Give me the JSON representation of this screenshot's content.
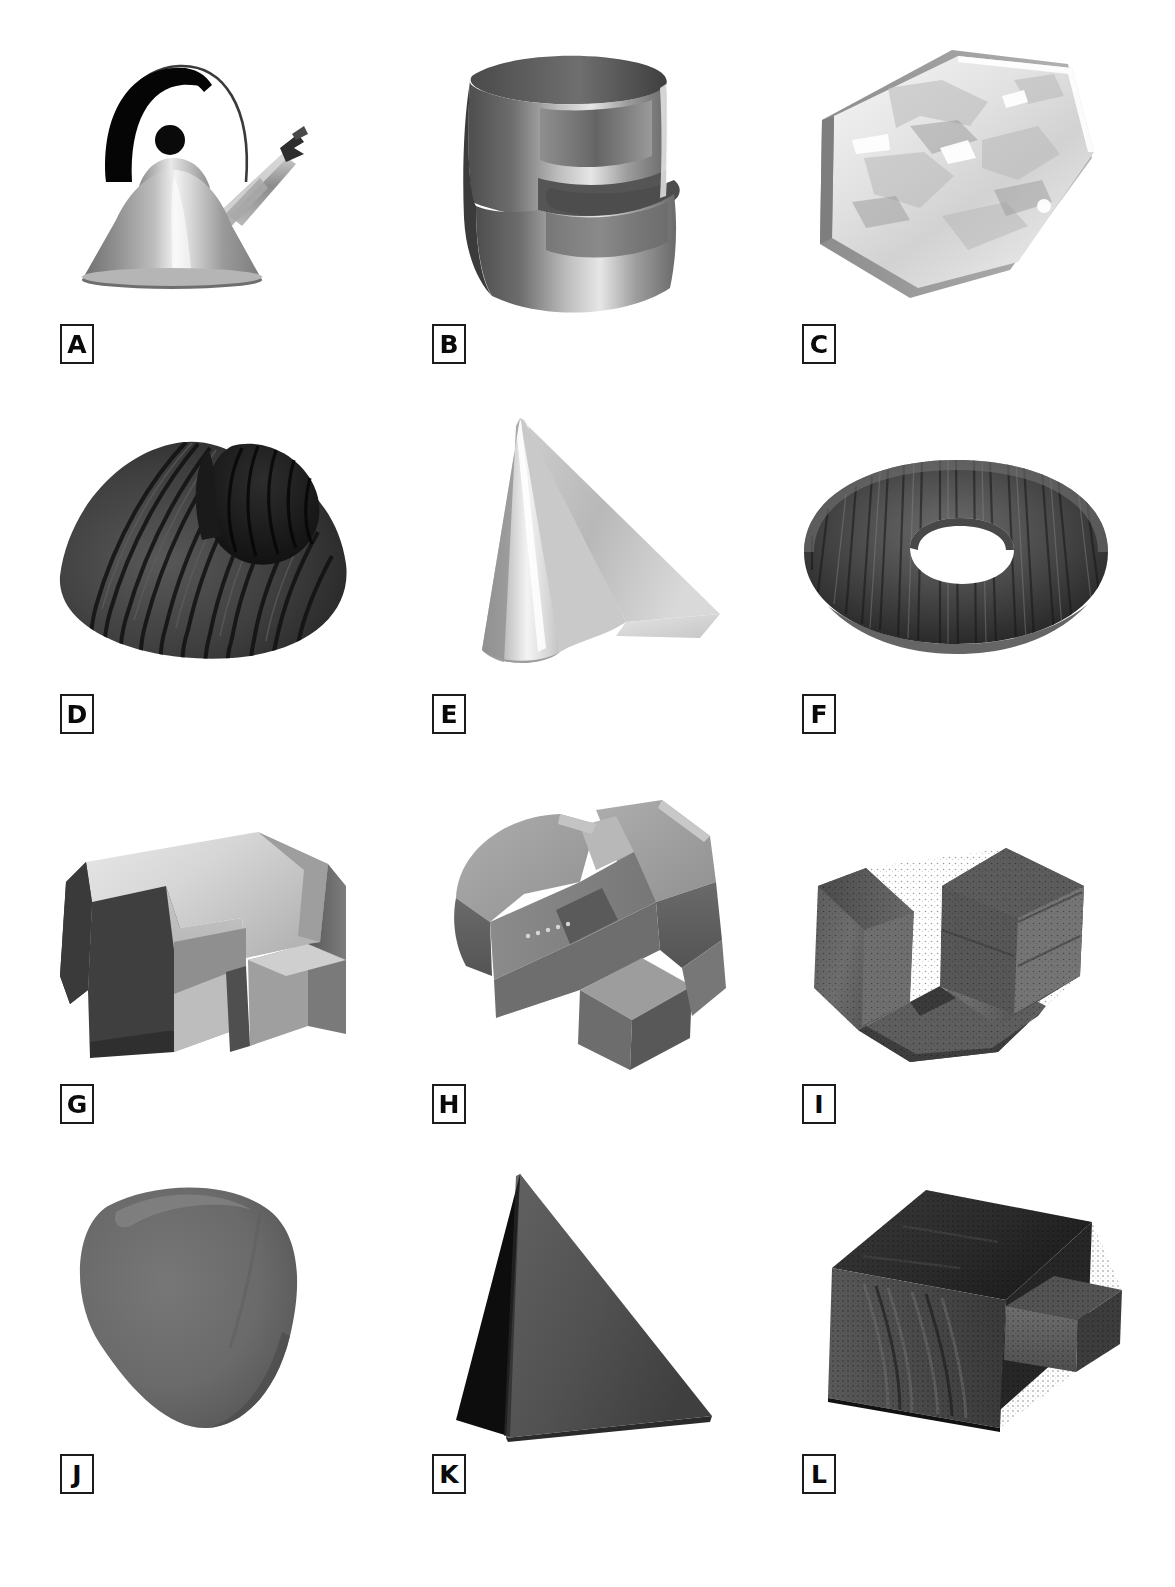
{
  "plate": {
    "background_color": "#ffffff",
    "columns": 3,
    "rows": 4,
    "label_style": "boxed-uppercase-letter"
  },
  "figures": [
    {
      "label": "A",
      "name": "teakettle",
      "description": "Conical stainless teakettle with black arc handle, wire loop, knob and bird whistle spout",
      "row": 1,
      "col": 1,
      "tone": "light-gray-specular"
    },
    {
      "label": "B",
      "name": "curved-spiral-extrusion",
      "description": "Smooth E-shaped / spiral curved ribbon extrusion, metallic shading",
      "row": 1,
      "col": 2,
      "tone": "mid-gray-gradient"
    },
    {
      "label": "C",
      "name": "hexagonal-slab",
      "description": "Flat hexagonal crystal slab with mottled bright texture",
      "row": 1,
      "col": 3,
      "tone": "very-light-gray-mottled"
    },
    {
      "label": "D",
      "name": "ribbed-shell",
      "description": "Dark ribbed bivalve shell form with concentric growth ridges",
      "row": 2,
      "col": 1,
      "tone": "dark-gray-ribbed"
    },
    {
      "label": "E",
      "name": "cone-with-fin",
      "description": "Light cone with a flat triangular fin projecting to the right",
      "row": 2,
      "col": 2,
      "tone": "light-gray"
    },
    {
      "label": "F",
      "name": "torus",
      "description": "Dark textured torus / donut seen obliquely",
      "row": 2,
      "col": 3,
      "tone": "dark-gray-textured"
    },
    {
      "label": "G",
      "name": "notched-block",
      "description": "Angular polyhedral block with stepped notches and a bright top face",
      "row": 3,
      "col": 1,
      "tone": "mixed-gray-faceted"
    },
    {
      "label": "H",
      "name": "interlocked-block",
      "description": "Mid-gray angular twisted block with interlocking L arms",
      "row": 3,
      "col": 2,
      "tone": "mid-gray-faceted"
    },
    {
      "label": "I",
      "name": "c-shaped-cylinder",
      "description": "Dark textured cylindrical block with a wedge cut, C-shaped profile",
      "row": 3,
      "col": 3,
      "tone": "dark-gray-textured"
    },
    {
      "label": "J",
      "name": "rounded-triangular-blob",
      "description": "Smooth rounded triangular solid, uniform matte gray",
      "row": 4,
      "col": 1,
      "tone": "mid-gray-matte"
    },
    {
      "label": "K",
      "name": "tetrahedron",
      "description": "Dark tetrahedron / pyramid with one black shadowed face",
      "row": 4,
      "col": 2,
      "tone": "dark-gray"
    },
    {
      "label": "L",
      "name": "box-with-arm",
      "description": "Dark textured rectangular box with a protruding rectangular arm",
      "row": 4,
      "col": 3,
      "tone": "dark-gray-textured"
    }
  ],
  "colors": {
    "page": "#ffffff",
    "ink": "#0a0a0a",
    "label_border": "#1b1b1b",
    "light_gray": "#d8d8d8",
    "mid_gray": "#9a9a9a",
    "dark_gray": "#4a4a4a",
    "near_black": "#1c1c1c"
  }
}
